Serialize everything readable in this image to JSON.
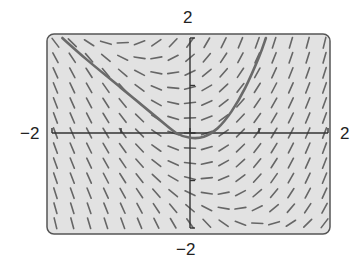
{
  "figure": {
    "type": "slope-field",
    "colors": {
      "frame_background": "#e2e2e2",
      "frame_border": "#555555",
      "segment": "#666666",
      "axis": "#333333",
      "solution_curve": "#6a6a6a"
    }
  },
  "axes": {
    "x_min_label": "−2",
    "x_max_label": "2",
    "y_min_label": "−2",
    "y_max_label": "2",
    "x_range": [
      -2,
      2
    ],
    "y_range": [
      -2,
      2
    ],
    "x_ticks": [
      -2,
      -1,
      0,
      1,
      2
    ],
    "y_ticks": [
      -2,
      -1,
      0,
      1,
      2
    ]
  },
  "chart_data": {
    "type": "line",
    "title": "",
    "xlabel": "",
    "ylabel": "",
    "xlim": [
      -2,
      2
    ],
    "ylim": [
      -2,
      2
    ],
    "grid": false,
    "series": [
      {
        "name": "solution curve",
        "x": [
          -1.85,
          -1.5,
          -1.0,
          -0.5,
          -0.2,
          0.0,
          0.2,
          0.4,
          0.6,
          0.8,
          1.0,
          1.1
        ],
        "y": [
          2.0,
          1.55,
          0.95,
          0.35,
          0.0,
          -0.1,
          -0.08,
          0.1,
          0.45,
          0.95,
          1.6,
          2.0
        ]
      }
    ],
    "slope_field": {
      "grid_x_count": 17,
      "grid_y_count": 13,
      "zero_slope_curve_points": [
        [
          -0.3,
          1.7
        ],
        [
          0.0,
          0.0
        ],
        [
          0.3,
          -1.8
        ]
      ]
    }
  }
}
